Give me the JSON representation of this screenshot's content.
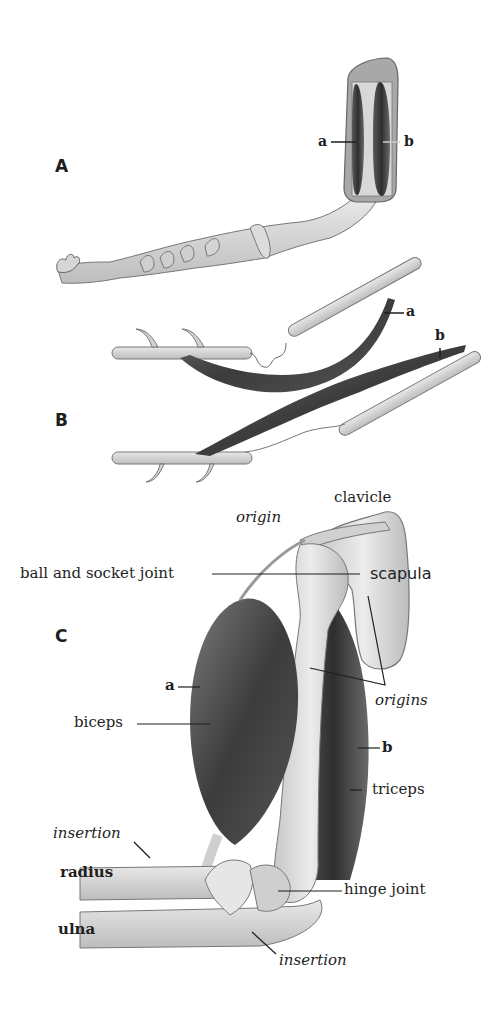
{
  "figure": {
    "panels": {
      "a": "A",
      "b": "B",
      "c": "C"
    },
    "panel_a": {
      "label_a": "a",
      "label_b": "b"
    },
    "panel_b": {
      "label_a": "a",
      "label_b": "b"
    },
    "panel_c": {
      "clavicle": "clavicle",
      "origin": "origin",
      "ball_socket": "ball and socket joint",
      "scapula": "scapula",
      "label_a": "a",
      "origins": "origins",
      "biceps": "biceps",
      "label_b": "b",
      "triceps": "triceps",
      "insertion_top": "insertion",
      "radius": "radius",
      "hinge_joint": "hinge joint",
      "ulna": "ulna",
      "insertion_bottom": "insertion"
    },
    "colors": {
      "muscle_dark": "#3a3a3a",
      "muscle_mid": "#6a6a6a",
      "bone_light": "#dedede",
      "bone_mid": "#c4c4c4",
      "outline": "#555555",
      "ink": "#1e1e1e"
    }
  }
}
